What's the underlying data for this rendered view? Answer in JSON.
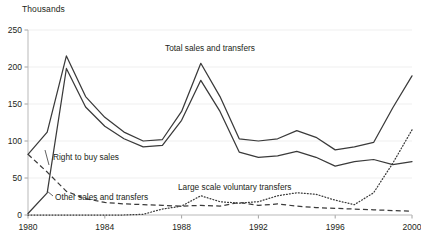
{
  "figure": {
    "unit_label": "Thousands"
  },
  "chart_data": {
    "type": "line",
    "title": "",
    "subtitle": "",
    "xlabel": "",
    "ylabel": "Thousands",
    "grid": true,
    "legend_position": "inline-annotations",
    "xlim": [
      1980,
      2000
    ],
    "ylim": [
      0,
      250
    ],
    "ytick_labels": [
      "0",
      "50",
      "100",
      "150",
      "200",
      "250"
    ],
    "ytick_values": [
      0,
      50,
      100,
      150,
      200,
      250
    ],
    "xtick_labels": [
      "1980",
      "1984",
      "1988",
      "1992",
      "1996",
      "2000"
    ],
    "xtick_values": [
      1980,
      1984,
      1988,
      1992,
      1996,
      2000
    ],
    "x": [
      1980,
      1981,
      1982,
      1983,
      1984,
      1985,
      1986,
      1987,
      1988,
      1989,
      1990,
      1991,
      1992,
      1993,
      1994,
      1995,
      1996,
      1997,
      1998,
      1999,
      2000
    ],
    "series": [
      {
        "name": "Total sales and transfers",
        "style": "solid",
        "label_text": "Total sales and transfers",
        "values": [
          82,
          112,
          215,
          160,
          132,
          112,
          100,
          102,
          140,
          205,
          160,
          103,
          100,
          103,
          114,
          105,
          88,
          92,
          98,
          145,
          188
        ]
      },
      {
        "name": "Right to buy sales",
        "style": "solid",
        "label_text": "Right to buy sales",
        "values": [
          2,
          30,
          198,
          146,
          120,
          103,
          92,
          94,
          128,
          182,
          140,
          85,
          78,
          80,
          86,
          78,
          66,
          72,
          75,
          68,
          72
        ]
      },
      {
        "name": "Other sales and transfers",
        "style": "dashed",
        "label_text": "Other sales and transfers",
        "values": [
          82,
          58,
          32,
          22,
          17,
          15,
          14,
          13,
          12,
          13,
          12,
          17,
          13,
          15,
          12,
          10,
          9,
          8,
          7,
          6,
          5
        ]
      },
      {
        "name": "Large scale voluntary transfers",
        "style": "dotted",
        "label_text": "Large scale voluntary transfers",
        "values": [
          0,
          0,
          0,
          0,
          0,
          0,
          1,
          8,
          12,
          26,
          18,
          16,
          18,
          26,
          30,
          28,
          20,
          14,
          30,
          70,
          115
        ]
      }
    ]
  }
}
